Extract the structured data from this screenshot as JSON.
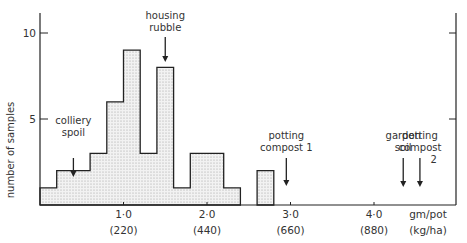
{
  "chart_data": {
    "type": "bar",
    "subtype": "histogram",
    "title": "",
    "xlabel": "gm/pot (kg/ha)",
    "ylabel": "number of samples",
    "x_unit_top": "gm/pot",
    "x_unit_bottom": "(kg/ha)",
    "bin_width": 0.2,
    "bins": [
      {
        "x0": 0.0,
        "x1": 0.2,
        "count": 1
      },
      {
        "x0": 0.2,
        "x1": 0.4,
        "count": 2
      },
      {
        "x0": 0.4,
        "x1": 0.6,
        "count": 2
      },
      {
        "x0": 0.6,
        "x1": 0.8,
        "count": 3
      },
      {
        "x0": 0.8,
        "x1": 1.0,
        "count": 6
      },
      {
        "x0": 1.0,
        "x1": 1.2,
        "count": 9
      },
      {
        "x0": 1.2,
        "x1": 1.4,
        "count": 3
      },
      {
        "x0": 1.4,
        "x1": 1.6,
        "count": 8
      },
      {
        "x0": 1.6,
        "x1": 1.8,
        "count": 1
      },
      {
        "x0": 1.8,
        "x1": 2.0,
        "count": 3
      },
      {
        "x0": 2.0,
        "x1": 2.2,
        "count": 3
      },
      {
        "x0": 2.2,
        "x1": 2.4,
        "count": 1
      },
      {
        "x0": 2.4,
        "x1": 2.6,
        "count": 0
      },
      {
        "x0": 2.6,
        "x1": 2.8,
        "count": 2
      }
    ],
    "categories": [
      "0.0-0.2",
      "0.2-0.4",
      "0.4-0.6",
      "0.6-0.8",
      "0.8-1.0",
      "1.0-1.2",
      "1.2-1.4",
      "1.4-1.6",
      "1.6-1.8",
      "1.8-2.0",
      "2.0-2.2",
      "2.2-2.4",
      "2.4-2.6",
      "2.6-2.8"
    ],
    "values": [
      1,
      2,
      2,
      3,
      6,
      9,
      3,
      8,
      1,
      3,
      3,
      1,
      0,
      2
    ],
    "xlim": [
      0,
      5.0
    ],
    "ylim": [
      0,
      11
    ],
    "x_ticks": [
      {
        "value": 1.0,
        "label": "1·0",
        "sublabel": "(220)"
      },
      {
        "value": 2.0,
        "label": "2·0",
        "sublabel": "(440)"
      },
      {
        "value": 3.0,
        "label": "3·0",
        "sublabel": "(660)"
      },
      {
        "value": 4.0,
        "label": "4·0",
        "sublabel": "(880)"
      }
    ],
    "y_ticks": [
      {
        "value": 5,
        "label": "5"
      },
      {
        "value": 10,
        "label": "10"
      }
    ],
    "annotations": [
      {
        "text_lines": [
          "colliery",
          "spoil"
        ],
        "x": 0.4,
        "arrow": true
      },
      {
        "text_lines": [
          "housing",
          "rubble"
        ],
        "x": 1.5,
        "arrow": true
      },
      {
        "text_lines": [
          "potting",
          "compost 1"
        ],
        "x": 2.95,
        "arrow": true
      },
      {
        "text_lines": [
          "garden",
          "soil"
        ],
        "x": 4.35,
        "arrow": true
      },
      {
        "text_lines": [
          "potting",
          "compost",
          "2"
        ],
        "x": 4.55,
        "arrow": true
      }
    ],
    "grid": false,
    "legend": null,
    "fill_pattern": "stippled"
  }
}
